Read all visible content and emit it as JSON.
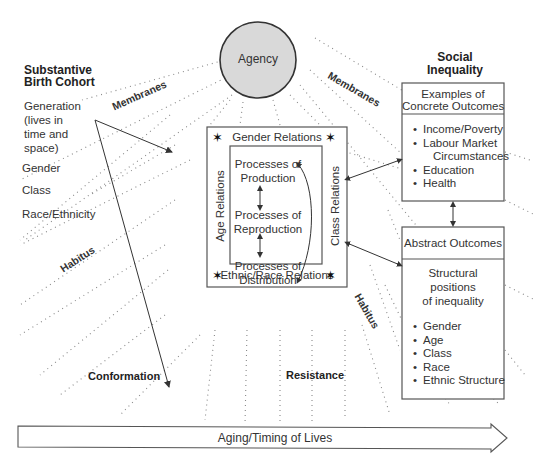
{
  "center": {
    "agency": "Agency",
    "inner_box": {
      "top_label": "Gender Relations",
      "bottom_label": "Ethnic/Race Relations",
      "left_label": "Age Relations",
      "right_label": "Class Relations",
      "processes": [
        "Processes of Production",
        "Processes of Reproduction",
        "Processes of Distribution"
      ],
      "process_lines": [
        [
          "Processes of",
          "Production"
        ],
        [
          "Processes of",
          "Reproduction"
        ],
        [
          "Processes of",
          "Distribution"
        ]
      ]
    },
    "star_glyph": "✶"
  },
  "left": {
    "heading_line1": "Substantive",
    "heading_line2": "Birth Cohort",
    "generation_lines": [
      "Generation",
      "(lives in",
      "time and",
      "space)"
    ],
    "items": [
      "Gender",
      "Class",
      "Race/Ethnicity"
    ]
  },
  "right": {
    "heading_line1": "Social",
    "heading_line2": "Inequality",
    "concrete_box": {
      "title_line1": "Examples of",
      "title_line2": "Concrete Outcomes",
      "items": [
        "Income/Poverty",
        "Labour Market",
        "Circumstances",
        "Education",
        "Health"
      ]
    },
    "abstract_box": {
      "title": "Abstract Outcomes",
      "subtitle_lines": [
        "Structural",
        "positions",
        "of inequality"
      ],
      "items": [
        "Gender",
        "Age",
        "Class",
        "Race",
        "Ethnic Structure"
      ]
    }
  },
  "ray_labels": {
    "membranes_left": "Membranes",
    "membranes_right": "Membranes",
    "habitus_left": "Habitus",
    "habitus_right": "Habitus",
    "conformation": "Conformation",
    "resistance": "Resistance"
  },
  "timeline": {
    "label": "Aging/Timing of Lives"
  }
}
